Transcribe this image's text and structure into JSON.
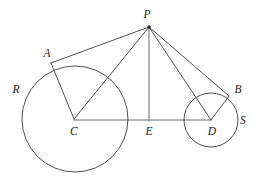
{
  "figure": {
    "kind": "euclidean-geometry-diagram",
    "background_color": "#ffffff",
    "ink_color": "#3b3b42",
    "label_color": "#1d1d22",
    "width": 264,
    "height": 189
  },
  "points": [
    {
      "id": "P",
      "label": "P",
      "x": 149,
      "y": 27,
      "label_x": 147,
      "label_y": 15,
      "dot": true
    },
    {
      "id": "A",
      "label": "A",
      "x": 53,
      "y": 63,
      "label_x": 47,
      "label_y": 54,
      "dot": false
    },
    {
      "id": "B",
      "label": "B",
      "x": 228,
      "y": 96,
      "label_x": 238,
      "label_y": 90,
      "dot": false
    },
    {
      "id": "C",
      "label": "C",
      "x": 74,
      "y": 119,
      "label_x": 74,
      "label_y": 132,
      "dot": false
    },
    {
      "id": "E",
      "label": "E",
      "x": 149,
      "y": 120,
      "label_x": 149,
      "label_y": 132,
      "dot": false
    },
    {
      "id": "D",
      "label": "D",
      "x": 211,
      "y": 120,
      "label_x": 212,
      "label_y": 132,
      "dot": false
    },
    {
      "id": "R",
      "label": "R",
      "x": 16,
      "y": 90,
      "label_x": 16,
      "label_y": 90,
      "dot": false
    },
    {
      "id": "S",
      "label": "S",
      "x": 243,
      "y": 121,
      "label_x": 243,
      "label_y": 121,
      "dot": false
    }
  ],
  "circles": [
    {
      "id": "circle-R",
      "name": "large-circle-R",
      "center": "C",
      "cx": 75,
      "cy": 119,
      "r": 53,
      "tangent_point": "A",
      "region_label": "R"
    },
    {
      "id": "circle-S",
      "name": "small-circle-S",
      "center": "D",
      "cx": 211,
      "cy": 120,
      "r": 27,
      "tangent_point": "B",
      "region_label": "S"
    }
  ],
  "segments": [
    {
      "id": "PA",
      "name": "tangent-segment-PA",
      "from": "P",
      "to": "A",
      "x1": 149,
      "y1": 27,
      "x2": 52,
      "y2": 63
    },
    {
      "id": "PC",
      "name": "segment-PC",
      "from": "P",
      "to": "C",
      "x1": 149,
      "y1": 27,
      "x2": 74,
      "y2": 119
    },
    {
      "id": "PE",
      "name": "altitude-segment-PE",
      "from": "P",
      "to": "E",
      "x1": 149,
      "y1": 27,
      "x2": 149,
      "y2": 121
    },
    {
      "id": "PD",
      "name": "segment-PD",
      "from": "P",
      "to": "D",
      "x1": 149,
      "y1": 27,
      "x2": 211,
      "y2": 120
    },
    {
      "id": "PB",
      "name": "tangent-segment-PB",
      "from": "P",
      "to": "B",
      "x1": 149,
      "y1": 27,
      "x2": 229,
      "y2": 96
    },
    {
      "id": "CA",
      "name": "radius-segment-CA",
      "from": "C",
      "to": "A",
      "x1": 74,
      "y1": 119,
      "x2": 52,
      "y2": 63
    },
    {
      "id": "DB",
      "name": "radius-segment-DB",
      "from": "D",
      "to": "B",
      "x1": 211,
      "y1": 120,
      "x2": 229,
      "y2": 96
    },
    {
      "id": "CD",
      "name": "baseline-segment-CD",
      "from": "C",
      "to": "D",
      "x1": 74,
      "y1": 120,
      "x2": 211,
      "y2": 120
    }
  ]
}
